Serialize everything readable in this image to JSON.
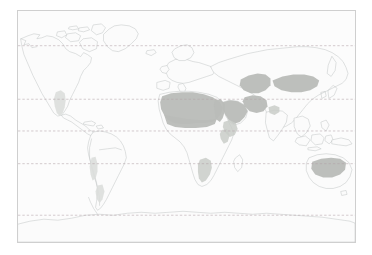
{
  "figure": {
    "kind": "world-map",
    "title": "",
    "caption": "",
    "background_color": "#ffffff"
  },
  "map": {
    "projection": "equirectangular",
    "frame": {
      "x": 17,
      "y": 10,
      "width": 339,
      "height": 233,
      "border_color": "#cfcfcf",
      "fill_color": "#fcfcfc"
    },
    "lon_range": [
      -180,
      180
    ],
    "lat_range": [
      -90,
      83
    ],
    "land": {
      "fill_color": "#fbfbfb",
      "outline_color": "#b9bdbd",
      "outline_width": 0.45
    },
    "graticule": {
      "visible": true,
      "style": "dashed",
      "color": "#b2a0a6",
      "lines": [
        {
          "name": "arctic-circle",
          "label": "Arctic Circle",
          "latitude": 66.5,
          "y": 35
        },
        {
          "name": "tropic-of-cancer",
          "label": "Tropic of Cancer",
          "latitude": 23.5,
          "y": 89
        },
        {
          "name": "equator",
          "label": "Equator",
          "latitude": 0,
          "y": 121
        },
        {
          "name": "tropic-of-capricorn",
          "label": "Tropic of Capricorn",
          "latitude": -23.5,
          "y": 154
        },
        {
          "name": "antarctic-circle",
          "label": "Antarctic Circle",
          "latitude": -66.5,
          "y": 206
        }
      ]
    },
    "legend": {
      "visible": false,
      "entries": [
        {
          "label": "Desert / arid region",
          "color": "#b9bcb8"
        }
      ]
    },
    "highlighted_regions": [
      {
        "name": "sahara",
        "label": "Sahara",
        "continent": "Africa",
        "intensity": "strong",
        "color": "#b9bcb8"
      },
      {
        "name": "arabian",
        "label": "Arabian Desert",
        "continent": "Asia",
        "intensity": "strong",
        "color": "#b9bcb8"
      },
      {
        "name": "iranian-plateau",
        "label": "Iranian Plateau Deserts",
        "continent": "Asia",
        "intensity": "strong",
        "color": "#b9bcb8"
      },
      {
        "name": "caspian-turan",
        "label": "Turan / Karakum–Kyzylkum",
        "continent": "Asia",
        "intensity": "strong",
        "color": "#b9bcb8"
      },
      {
        "name": "gobi-taklamakan",
        "label": "Gobi / Taklamakan",
        "continent": "Asia",
        "intensity": "strong",
        "color": "#b9bcb8"
      },
      {
        "name": "thar",
        "label": "Thar Desert",
        "continent": "Asia",
        "intensity": "mid",
        "color": "#c9ccc8"
      },
      {
        "name": "horn-of-africa",
        "label": "Horn of Africa / Danakil",
        "continent": "Africa",
        "intensity": "mid",
        "color": "#c9ccc8"
      },
      {
        "name": "namib-kalahari",
        "label": "Namib / Kalahari",
        "continent": "Africa",
        "intensity": "mid",
        "color": "#c9ccc8"
      },
      {
        "name": "australian-interior",
        "label": "Australian Interior Deserts",
        "continent": "Australia",
        "intensity": "strong",
        "color": "#b9bcb8"
      },
      {
        "name": "southwest-north-america",
        "label": "Sonoran / Mojave / Chihuahuan",
        "continent": "North America",
        "intensity": "faint",
        "color": "#dcdedb"
      },
      {
        "name": "atacama-patagonia",
        "label": "Atacama / Patagonia",
        "continent": "South America",
        "intensity": "faint",
        "color": "#dcdedb"
      }
    ],
    "landmasses": [
      {
        "name": "north-america",
        "label": "North America"
      },
      {
        "name": "south-america",
        "label": "South America"
      },
      {
        "name": "africa",
        "label": "Africa"
      },
      {
        "name": "europe",
        "label": "Europe"
      },
      {
        "name": "asia",
        "label": "Asia"
      },
      {
        "name": "australia",
        "label": "Australia"
      },
      {
        "name": "antarctica",
        "label": "Antarctica"
      },
      {
        "name": "greenland",
        "label": "Greenland"
      }
    ]
  }
}
